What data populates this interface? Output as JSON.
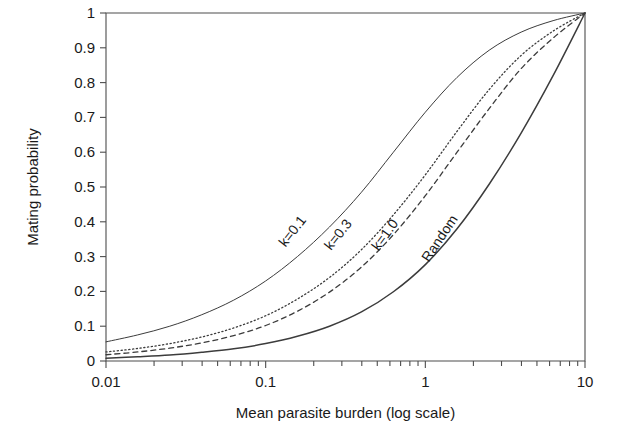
{
  "chart_data": {
    "type": "line",
    "title": "",
    "xlabel": "Mean parasite burden (log scale)",
    "ylabel": "Mating probability",
    "xscale": "log",
    "xlim": [
      0.01,
      10
    ],
    "ylim": [
      0,
      1
    ],
    "grid": false,
    "legend": "inline-curve-labels",
    "xticks_major": [
      0.01,
      0.1,
      1,
      10
    ],
    "xtick_labels": [
      "0.01",
      "0.1",
      "1",
      "10"
    ],
    "yticks": [
      0,
      0.1,
      0.2,
      0.3,
      0.4,
      0.5,
      0.6,
      0.7,
      0.8,
      0.9,
      1
    ],
    "ytick_labels": [
      "0",
      "0.1",
      "0.2",
      "0.3",
      "0.4",
      "0.5",
      "0.6",
      "0.7",
      "0.8",
      "0.9",
      "1"
    ],
    "x": [
      0.01,
      0.0158,
      0.0251,
      0.0398,
      0.0631,
      0.1,
      0.158,
      0.251,
      0.398,
      0.631,
      1.0,
      1.58,
      2.51,
      3.98,
      6.31,
      10.0
    ],
    "series": [
      {
        "name": "k=0.1",
        "label": "k=0.1",
        "style": "solid-thin",
        "color": "#555555",
        "linewidth": 1.0,
        "dash": "none",
        "label_x": 0.155,
        "label_y": 0.365,
        "label_rotation": -52,
        "values": [
          0.055,
          0.075,
          0.1,
          0.133,
          0.175,
          0.23,
          0.3,
          0.385,
          0.485,
          0.6,
          0.715,
          0.815,
          0.893,
          0.945,
          0.978,
          1.0
        ]
      },
      {
        "name": "k=0.3",
        "label": "k=0.3",
        "style": "dotted",
        "color": "#555555",
        "linewidth": 1.3,
        "dash": "1.2 2.6",
        "label_x": 0.3,
        "label_y": 0.355,
        "label_rotation": -52,
        "values": [
          0.026,
          0.036,
          0.05,
          0.069,
          0.095,
          0.13,
          0.178,
          0.24,
          0.32,
          0.42,
          0.535,
          0.66,
          0.78,
          0.878,
          0.948,
          1.0
        ]
      },
      {
        "name": "k=1.0",
        "label": "k=1.0",
        "style": "dashed",
        "color": "#4a4a4a",
        "linewidth": 1.3,
        "dash": "5 4",
        "label_x": 0.59,
        "label_y": 0.355,
        "label_rotation": -54,
        "values": [
          0.018,
          0.026,
          0.037,
          0.052,
          0.073,
          0.102,
          0.143,
          0.198,
          0.27,
          0.363,
          0.475,
          0.6,
          0.725,
          0.84,
          0.928,
          1.0
        ]
      },
      {
        "name": "Random",
        "label": "Random",
        "style": "solid",
        "color": "#3c3c3c",
        "linewidth": 1.5,
        "dash": "none",
        "label_x": 1.3,
        "label_y": 0.345,
        "label_rotation": -56,
        "values": [
          0.008,
          0.012,
          0.017,
          0.025,
          0.035,
          0.05,
          0.071,
          0.1,
          0.141,
          0.199,
          0.277,
          0.38,
          0.508,
          0.655,
          0.82,
          1.0
        ]
      }
    ]
  },
  "layout": {
    "plot_left": 106,
    "plot_right": 585,
    "plot_top": 13,
    "plot_bottom": 361
  }
}
